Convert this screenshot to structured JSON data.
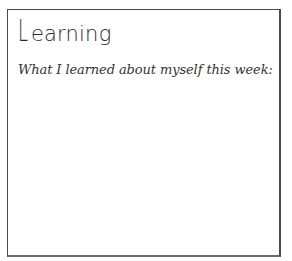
{
  "section": {
    "title_first_letter": "L",
    "title_rest": "earning",
    "prompt": "What I learned about myself this week:",
    "response": ""
  }
}
